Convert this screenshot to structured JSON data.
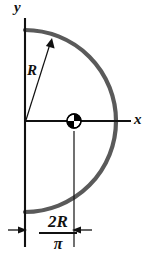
{
  "figure": {
    "axes": {
      "y_label": "y",
      "x_label": "x"
    },
    "annotations": {
      "radius_label": "R",
      "dimension_numerator": "2R",
      "dimension_denominator": "π"
    },
    "colors": {
      "arc": "#5a5a5a",
      "axis": "#111111",
      "marker_dark": "#000000",
      "marker_light": "#ffffff",
      "background": "#ffffff"
    },
    "geometry": {
      "origin_x": 25,
      "origin_y": 121,
      "radius_px": 91,
      "centroid_x": 74,
      "centroid_y": 121,
      "marker_radius_px": 7
    }
  }
}
